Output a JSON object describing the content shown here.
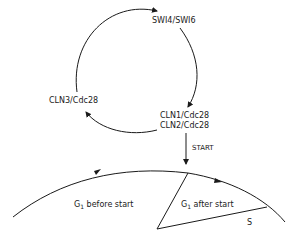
{
  "diagram": {
    "cycle_labels": {
      "top": "SWI4/SWI6",
      "left": "CLN3/Cdc28",
      "right_line1": "CLN1/Cdc28",
      "right_line2": "CLN2/Cdc28"
    },
    "transition": {
      "label": "START"
    },
    "phases": {
      "g1_before": {
        "prefix": "G",
        "subscript": "1",
        "suffix": "before start"
      },
      "g1_after": {
        "prefix": "G",
        "subscript": "1",
        "suffix": "after start"
      },
      "s": "S"
    },
    "colors": {
      "line": "#1a1a1a",
      "background": "#ffffff"
    }
  }
}
